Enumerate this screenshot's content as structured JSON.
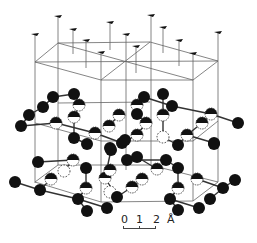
{
  "figure": {
    "colors": {
      "atom": "#111111",
      "line": "#333333",
      "thin_line": "#666666",
      "background": "#ffffff"
    }
  },
  "scale_bar": {
    "labels": [
      "0",
      "1",
      "2",
      "Å"
    ],
    "unit": "Å"
  },
  "flags": [
    [
      35,
      34
    ],
    [
      58,
      16
    ],
    [
      73,
      29
    ],
    [
      86,
      40
    ],
    [
      110,
      22
    ],
    [
      101,
      52
    ],
    [
      126,
      34
    ],
    [
      136,
      46
    ],
    [
      151,
      15
    ],
    [
      163,
      27
    ],
    [
      179,
      40
    ],
    [
      193,
      53
    ],
    [
      218,
      32
    ]
  ],
  "verticals": [
    [
      35,
      34,
      35,
      183
    ],
    [
      58,
      16,
      58,
      165
    ],
    [
      101,
      52,
      101,
      202
    ],
    [
      126,
      34,
      126,
      170
    ],
    [
      151,
      15,
      151,
      165
    ],
    [
      193,
      53,
      193,
      201
    ],
    [
      218,
      32,
      218,
      182
    ],
    [
      73,
      29,
      73,
      54
    ],
    [
      86,
      40,
      86,
      68
    ],
    [
      110,
      22,
      110,
      50
    ],
    [
      136,
      46,
      136,
      73
    ],
    [
      163,
      27,
      163,
      53
    ],
    [
      179,
      40,
      179,
      66
    ]
  ],
  "lattice_lines": [
    [
      35,
      62,
      58,
      43
    ],
    [
      58,
      43,
      150,
      42
    ],
    [
      150,
      42,
      218,
      61
    ],
    [
      218,
      61,
      193,
      80
    ],
    [
      193,
      80,
      101,
      80
    ],
    [
      101,
      80,
      35,
      62
    ],
    [
      35,
      62,
      218,
      61
    ],
    [
      58,
      43,
      193,
      80
    ],
    [
      150,
      42,
      101,
      80
    ],
    [
      58,
      103,
      150,
      102
    ],
    [
      35,
      123,
      101,
      141
    ],
    [
      101,
      141,
      193,
      141
    ],
    [
      193,
      141,
      218,
      121
    ],
    [
      58,
      165,
      150,
      165
    ],
    [
      35,
      182,
      101,
      202
    ],
    [
      101,
      202,
      193,
      201
    ],
    [
      193,
      201,
      218,
      182
    ],
    [
      35,
      182,
      58,
      165
    ],
    [
      150,
      165,
      218,
      182
    ]
  ],
  "bonds": [
    [
      53,
      97,
      74,
      94
    ],
    [
      74,
      94,
      79,
      105
    ],
    [
      53,
      97,
      43,
      107
    ],
    [
      43,
      107,
      29,
      115
    ],
    [
      29,
      115,
      21,
      126
    ],
    [
      79,
      105,
      74,
      117
    ],
    [
      74,
      117,
      74,
      138
    ],
    [
      21,
      126,
      56,
      123
    ],
    [
      56,
      123,
      95,
      133
    ],
    [
      95,
      133,
      122,
      143
    ],
    [
      87,
      144,
      74,
      138
    ],
    [
      109,
      126,
      119,
      115
    ],
    [
      144,
      97,
      172,
      106
    ],
    [
      163,
      94,
      163,
      115
    ],
    [
      137,
      105,
      137,
      114
    ],
    [
      137,
      114,
      146,
      123
    ],
    [
      163,
      115,
      163,
      137
    ],
    [
      146,
      123,
      137,
      135
    ],
    [
      137,
      135,
      122,
      143
    ],
    [
      172,
      106,
      211,
      114
    ],
    [
      211,
      114,
      238,
      123
    ],
    [
      211,
      114,
      202,
      123
    ],
    [
      202,
      123,
      187,
      135
    ],
    [
      187,
      135,
      178,
      145
    ],
    [
      187,
      135,
      214,
      143
    ],
    [
      163,
      137,
      178,
      145
    ],
    [
      38,
      162,
      73,
      160
    ],
    [
      73,
      160,
      64,
      171
    ],
    [
      15,
      182,
      40,
      190
    ],
    [
      40,
      190,
      51,
      179
    ],
    [
      40,
      190,
      78,
      199
    ],
    [
      78,
      199,
      86,
      188
    ],
    [
      86,
      168,
      86,
      188
    ],
    [
      78,
      199,
      87,
      211
    ],
    [
      78,
      199,
      107,
      208
    ],
    [
      117,
      197,
      105,
      178
    ],
    [
      105,
      178,
      111,
      150
    ],
    [
      127,
      160,
      166,
      160
    ],
    [
      166,
      160,
      178,
      168
    ],
    [
      137,
      157,
      157,
      169
    ],
    [
      178,
      168,
      178,
      188
    ],
    [
      142,
      179,
      132,
      187
    ],
    [
      132,
      187,
      117,
      197
    ],
    [
      178,
      188,
      170,
      199
    ],
    [
      170,
      199,
      178,
      210
    ],
    [
      170,
      199,
      199,
      208
    ],
    [
      210,
      199,
      223,
      188
    ],
    [
      223,
      188,
      235,
      180
    ],
    [
      197,
      179,
      223,
      188
    ]
  ],
  "atoms_solid": [
    [
      53,
      97
    ],
    [
      74,
      94
    ],
    [
      43,
      107
    ],
    [
      29,
      115
    ],
    [
      21,
      126
    ],
    [
      74,
      138
    ],
    [
      87,
      144
    ],
    [
      122,
      143
    ],
    [
      110,
      148
    ],
    [
      144,
      97
    ],
    [
      163,
      94
    ],
    [
      172,
      106
    ],
    [
      137,
      114
    ],
    [
      238,
      123
    ],
    [
      214,
      143
    ],
    [
      178,
      145
    ],
    [
      38,
      162
    ],
    [
      86,
      168
    ],
    [
      15,
      182
    ],
    [
      40,
      190
    ],
    [
      78,
      199
    ],
    [
      87,
      211
    ],
    [
      107,
      208
    ],
    [
      117,
      197
    ],
    [
      111,
      150
    ],
    [
      127,
      160
    ],
    [
      137,
      157
    ],
    [
      166,
      160
    ],
    [
      178,
      168
    ],
    [
      170,
      199
    ],
    [
      178,
      210
    ],
    [
      199,
      208
    ],
    [
      210,
      199
    ],
    [
      223,
      188
    ],
    [
      235,
      180
    ],
    [
      214,
      144
    ],
    [
      125,
      140
    ]
  ],
  "atoms_half": [
    [
      79,
      105
    ],
    [
      74,
      117
    ],
    [
      56,
      123
    ],
    [
      95,
      133
    ],
    [
      109,
      126
    ],
    [
      119,
      115
    ],
    [
      137,
      105
    ],
    [
      146,
      123
    ],
    [
      163,
      115
    ],
    [
      137,
      135
    ],
    [
      187,
      135
    ],
    [
      211,
      114
    ],
    [
      202,
      123
    ],
    [
      73,
      160
    ],
    [
      51,
      179
    ],
    [
      86,
      188
    ],
    [
      105,
      178
    ],
    [
      110,
      170
    ],
    [
      157,
      169
    ],
    [
      142,
      179
    ],
    [
      132,
      187
    ],
    [
      178,
      188
    ],
    [
      197,
      179
    ]
  ],
  "atoms_dashed": [
    [
      163,
      137
    ],
    [
      64,
      171
    ],
    [
      110,
      192
    ]
  ]
}
